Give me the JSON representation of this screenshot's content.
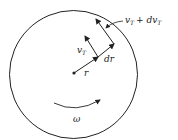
{
  "diagram": {
    "labels": {
      "radius": "r",
      "dr": "dr",
      "vt": "v",
      "vt_sub": "T",
      "vt_plus": "v",
      "vt_plus_sub": "T",
      "plus": "+ dv",
      "plus_sub": "T",
      "omega": "ω"
    },
    "colors": {
      "stroke": "#222222",
      "background": "#ffffff"
    }
  }
}
